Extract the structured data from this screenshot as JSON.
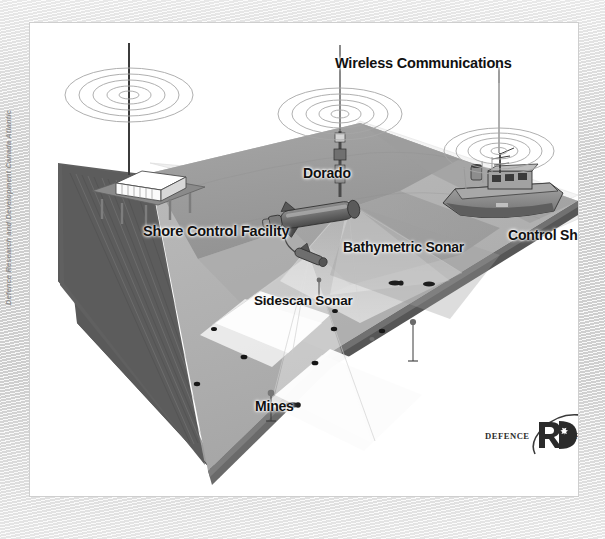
{
  "figure": {
    "title_vertical_credit": "Defence Research and Development Canada Atlantic",
    "background_color": "#e0e0e0",
    "card_color": "#ffffff"
  },
  "labels": {
    "wireless": "Wireless Communications",
    "dorado": "Dorado",
    "shore_control_facility": "Shore Control Facility",
    "bathymetric_sonar": "Bathymetric Sonar",
    "control_ship": "Control Ship",
    "sidescan_sonar": "Sidescan Sonar",
    "mines": "Mines"
  },
  "logo": {
    "word_en": "DEFENCE",
    "word_fr": "DÉFENSE",
    "mark": "R&D"
  },
  "colors": {
    "seafloor_top": "#b4b4b4",
    "seafloor_mid": "#a8a8a8",
    "terrain_hill": "#9a9a9a",
    "block_side_dark": "#5d5d5d",
    "block_side_mid": "#8a8a8a",
    "water_surface": "#e9e9e9",
    "sonar_beam": "#ffffff",
    "mine_body": "#1c1c1c",
    "vessel_hull": "#8f8f8f",
    "label_text": "#111111",
    "credit_text": "#8e8e8e"
  },
  "scene": {
    "elements": [
      {
        "name": "shore-control-facility",
        "kind": "structure",
        "detail": "white building on piled platform with antenna mast"
      },
      {
        "name": "dorado-auv",
        "kind": "vehicle",
        "detail": "torpedo-shaped autonomous underwater vehicle with surfaced mast"
      },
      {
        "name": "control-ship",
        "kind": "vessel",
        "detail": "surface ship with superstructure, mast and antennas"
      },
      {
        "name": "towfish",
        "kind": "sensor",
        "detail": "towed sidescan sonar body on cable from Dorado"
      },
      {
        "name": "sidescan-sonar-beam",
        "kind": "beam",
        "detail": "twin fan-shaped white swaths on seafloor"
      },
      {
        "name": "bathymetric-sonar-beam",
        "kind": "beam",
        "detail": "wide translucent fan from Dorado to seafloor"
      },
      {
        "name": "radio-waves",
        "kind": "signal",
        "count": 3,
        "detail": "concentric ellipse ripples above each antenna"
      },
      {
        "name": "mines",
        "kind": "target",
        "count": 12,
        "detail": "dark cylindrical and moored mines on the seabed"
      }
    ]
  }
}
